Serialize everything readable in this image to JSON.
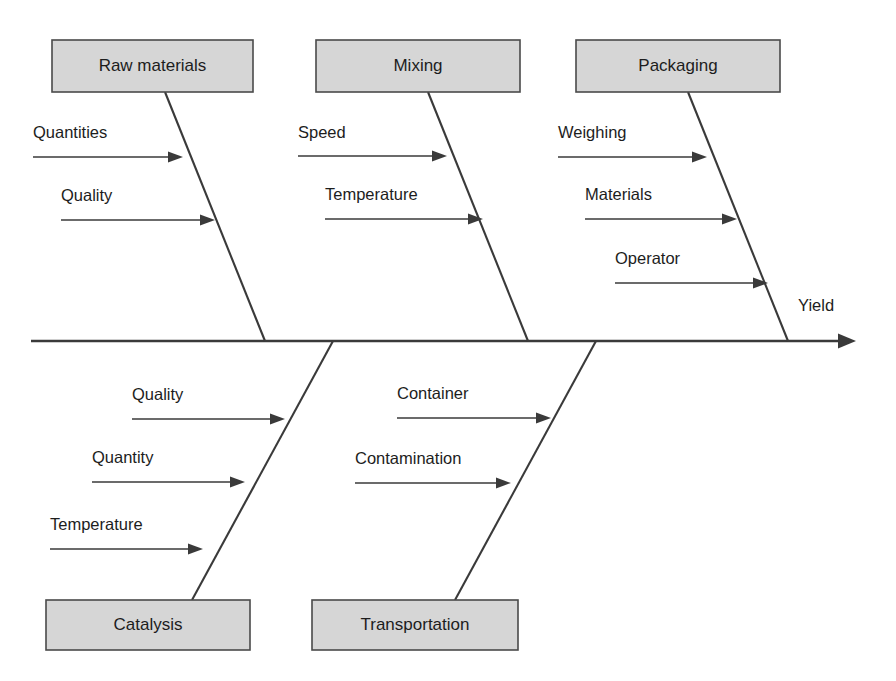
{
  "diagram": {
    "type": "fishbone-ishikawa",
    "effect_label": "Yield",
    "colors": {
      "box_fill": "#d6d6d6",
      "box_stroke": "#4a4a4a",
      "line": "#3a3a3a",
      "text": "#1d1d1d",
      "background": "#ffffff"
    },
    "categories": [
      {
        "id": "raw-materials",
        "label": "Raw materials",
        "side": "top",
        "box": {
          "x": 52,
          "y": 40,
          "w": 201,
          "h": 52
        },
        "bone": {
          "x1": 165,
          "y1": 92,
          "x2": 265,
          "y2": 341
        },
        "causes": [
          {
            "label": "Quantities",
            "label_x": 33,
            "label_y": 138,
            "line_x1": 33,
            "line_y1": 157,
            "line_x2": 183
          },
          {
            "label": "Quality",
            "label_x": 61,
            "label_y": 201,
            "line_x1": 61,
            "line_y1": 220,
            "line_x2": 215
          }
        ]
      },
      {
        "id": "mixing",
        "label": "Mixing",
        "side": "top",
        "box": {
          "x": 316,
          "y": 40,
          "w": 204,
          "h": 52
        },
        "bone": {
          "x1": 428,
          "y1": 92,
          "x2": 528,
          "y2": 341
        },
        "causes": [
          {
            "label": "Speed",
            "label_x": 298,
            "label_y": 138,
            "line_x1": 298,
            "line_y1": 156,
            "line_x2": 447
          },
          {
            "label": "Temperature",
            "label_x": 325,
            "label_y": 200,
            "line_x1": 325,
            "line_y1": 219,
            "line_x2": 483
          }
        ]
      },
      {
        "id": "packaging",
        "label": "Packaging",
        "side": "top",
        "box": {
          "x": 576,
          "y": 40,
          "w": 204,
          "h": 52
        },
        "bone": {
          "x1": 688,
          "y1": 92,
          "x2": 788,
          "y2": 341
        },
        "causes": [
          {
            "label": "Weighing",
            "label_x": 558,
            "label_y": 138,
            "line_x1": 558,
            "line_y1": 157,
            "line_x2": 707
          },
          {
            "label": "Materials",
            "label_x": 585,
            "label_y": 200,
            "line_x1": 585,
            "line_y1": 219,
            "line_x2": 737
          },
          {
            "label": "Operator",
            "label_x": 615,
            "label_y": 264,
            "line_x1": 615,
            "line_y1": 283,
            "line_x2": 768
          }
        ]
      },
      {
        "id": "catalysis",
        "label": "Catalysis",
        "side": "bottom",
        "box": {
          "x": 46,
          "y": 600,
          "w": 204,
          "h": 50
        },
        "bone": {
          "x1": 333,
          "y1": 341,
          "x2": 192,
          "y2": 600
        },
        "causes": [
          {
            "label": "Quality",
            "label_x": 132,
            "label_y": 400,
            "line_x1": 132,
            "line_y1": 419,
            "line_x2": 285
          },
          {
            "label": "Quantity",
            "label_x": 92,
            "label_y": 463,
            "line_x1": 92,
            "line_y1": 482,
            "line_x2": 245
          },
          {
            "label": "Temperature",
            "label_x": 50,
            "label_y": 530,
            "line_x1": 50,
            "line_y1": 549,
            "line_x2": 203
          }
        ]
      },
      {
        "id": "transportation",
        "label": "Transportation",
        "side": "bottom",
        "box": {
          "x": 312,
          "y": 600,
          "w": 206,
          "h": 50
        },
        "bone": {
          "x1": 596,
          "y1": 341,
          "x2": 455,
          "y2": 600
        },
        "causes": [
          {
            "label": "Container",
            "label_x": 397,
            "label_y": 399,
            "line_x1": 397,
            "line_y1": 418,
            "line_x2": 551
          },
          {
            "label": "Contamination",
            "label_x": 355,
            "label_y": 464,
            "line_x1": 355,
            "line_y1": 483,
            "line_x2": 511
          }
        ]
      }
    ],
    "spine": {
      "x1": 31,
      "y1": 341,
      "x2": 856
    },
    "effect_label_pos": {
      "x": 798,
      "y": 311
    }
  }
}
